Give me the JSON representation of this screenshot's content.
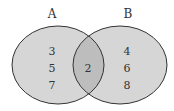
{
  "diagram": {
    "type": "venn",
    "sets": [
      {
        "label": "A",
        "only_elements": [
          "3",
          "5",
          "7"
        ]
      },
      {
        "label": "B",
        "only_elements": [
          "4",
          "6",
          "8"
        ]
      }
    ],
    "intersection": [
      "2"
    ],
    "colors": {
      "fill": "#d6d6d6",
      "overlap": "#bdbdbd",
      "stroke": "#333333"
    }
  }
}
